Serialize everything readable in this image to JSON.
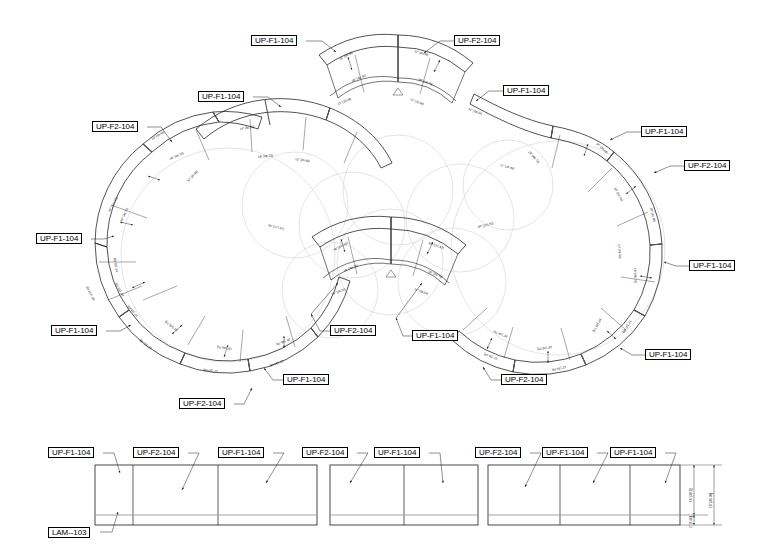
{
  "drawing": {
    "title": "Modular Curved Bench - Plan and Elevation",
    "sheet_bg": "#ffffff",
    "line_color": "#1a1a1a",
    "guide_color": "#d9d9dd",
    "joint_color": "#555555",
    "base_color": "#9a9a9a"
  },
  "part_codes": {
    "f1": "UP-F1-104",
    "f2": "UP-F2-104",
    "lam": "LAM--103"
  },
  "dimensions": {
    "seg_depth": "18\" [46.70]",
    "arc_12": "12\" [30.48]",
    "arc_14": "14\" [36.30]",
    "arc_48": "48\" [121.92]",
    "arc_10": "10\" [26.40]",
    "elev_height": "18\" [46.70]",
    "elev_body": "16\" [38.1]",
    "elev_base": "2\" [7.34]"
  },
  "plan_tags": [
    {
      "id": "tag-plan-1",
      "code": "UP-F1-104",
      "x": 251,
      "y": 35,
      "lx1": 306,
      "ly1": 41,
      "lx2": 322,
      "ly2": 41,
      "lx3": 336,
      "ly3": 52
    },
    {
      "id": "tag-plan-2",
      "code": "UP-F2-104",
      "x": 454,
      "y": 35,
      "lx1": 454,
      "ly1": 41,
      "lx2": 440,
      "ly2": 41,
      "lx3": 424,
      "ly3": 53
    },
    {
      "id": "tag-plan-3",
      "code": "UP-F1-104",
      "x": 198,
      "y": 91,
      "lx1": 253,
      "ly1": 97,
      "lx2": 268,
      "ly2": 97,
      "lx3": 281,
      "ly3": 107
    },
    {
      "id": "tag-plan-4",
      "code": "UP-F1-104",
      "x": 503,
      "y": 85,
      "lx1": 503,
      "ly1": 91,
      "lx2": 489,
      "ly2": 91,
      "lx3": 476,
      "ly3": 101
    },
    {
      "id": "tag-plan-5",
      "code": "UP-F2-104",
      "x": 92,
      "y": 121,
      "lx1": 147,
      "ly1": 127,
      "lx2": 161,
      "ly2": 127,
      "lx3": 172,
      "ly3": 142
    },
    {
      "id": "tag-plan-6",
      "code": "UP-F1-104",
      "x": 641,
      "y": 126,
      "lx1": 641,
      "ly1": 132,
      "lx2": 627,
      "ly2": 132,
      "lx3": 610,
      "ly3": 140
    },
    {
      "id": "tag-plan-7",
      "code": "UP-F2-104",
      "x": 684,
      "y": 160,
      "lx1": 684,
      "ly1": 166,
      "lx2": 670,
      "ly2": 166,
      "lx3": 654,
      "ly3": 173
    },
    {
      "id": "tag-plan-8",
      "code": "UP-F1-104",
      "x": 36,
      "y": 233,
      "lx1": 91,
      "ly1": 239,
      "lx2": 104,
      "ly2": 239,
      "lx3": 114,
      "ly3": 236
    },
    {
      "id": "tag-plan-9",
      "code": "UP-F1-104",
      "x": 689,
      "y": 260,
      "lx1": 689,
      "ly1": 266,
      "lx2": 676,
      "ly2": 266,
      "lx3": 664,
      "ly3": 262
    },
    {
      "id": "tag-plan-10",
      "code": "UP-F1-104",
      "x": 51,
      "y": 325,
      "lx1": 106,
      "ly1": 331,
      "lx2": 120,
      "ly2": 331,
      "lx3": 131,
      "ly3": 325
    },
    {
      "id": "tag-plan-11",
      "code": "UP-F2-104",
      "x": 330,
      "y": 325,
      "lx1": 330,
      "ly1": 331,
      "lx2": 320,
      "ly2": 331,
      "lx3": 311,
      "ly3": 314
    },
    {
      "id": "tag-plan-12",
      "code": "UP-F1-104",
      "x": 412,
      "y": 330,
      "lx1": 412,
      "ly1": 336,
      "lx2": 403,
      "ly2": 336,
      "lx3": 396,
      "ly3": 318
    },
    {
      "id": "tag-plan-13",
      "code": "UP-F1-104",
      "x": 645,
      "y": 349,
      "lx1": 645,
      "ly1": 355,
      "lx2": 632,
      "ly2": 355,
      "lx3": 620,
      "ly3": 348
    },
    {
      "id": "tag-plan-14",
      "code": "UP-F1-104",
      "x": 283,
      "y": 374,
      "lx1": 283,
      "ly1": 380,
      "lx2": 273,
      "ly2": 380,
      "lx3": 264,
      "ly3": 368
    },
    {
      "id": "tag-plan-15",
      "code": "UP-F2-104",
      "x": 501,
      "y": 374,
      "lx1": 501,
      "ly1": 380,
      "lx2": 491,
      "ly2": 380,
      "lx3": 483,
      "ly3": 367
    },
    {
      "id": "tag-plan-16",
      "code": "UP-F2-104",
      "x": 179,
      "y": 398,
      "lx1": 234,
      "ly1": 404,
      "lx2": 244,
      "ly2": 404,
      "lx3": 252,
      "ly3": 388
    }
  ],
  "elevation_tags": [
    {
      "id": "tag-elev-1",
      "code": "UP-F1-104",
      "x": 48,
      "y": 447,
      "lx1": 103,
      "ly1": 453,
      "lx2": 114,
      "ly2": 453,
      "lx3": 120,
      "ly3": 473
    },
    {
      "id": "tag-elev-2",
      "code": "UP-F2-104",
      "x": 133,
      "y": 447,
      "lx1": 188,
      "ly1": 453,
      "lx2": 199,
      "ly2": 453,
      "lx3": 182,
      "ly3": 490
    },
    {
      "id": "tag-elev-3",
      "code": "UP-F1-104",
      "x": 218,
      "y": 447,
      "lx1": 273,
      "ly1": 453,
      "lx2": 284,
      "ly2": 453,
      "lx3": 266,
      "ly3": 483
    },
    {
      "id": "tag-elev-4",
      "code": "UP-F2-104",
      "x": 302,
      "y": 447,
      "lx1": 357,
      "ly1": 453,
      "lx2": 368,
      "ly2": 453,
      "lx3": 350,
      "ly3": 483
    },
    {
      "id": "tag-elev-5",
      "code": "UP-F1-104",
      "x": 374,
      "y": 447,
      "lx1": 429,
      "ly1": 453,
      "lx2": 440,
      "ly2": 453,
      "lx3": 443,
      "ly3": 483
    },
    {
      "id": "tag-elev-6",
      "code": "UP-F2-104",
      "x": 475,
      "y": 447,
      "lx1": 530,
      "ly1": 453,
      "lx2": 541,
      "ly2": 453,
      "lx3": 525,
      "ly3": 487
    },
    {
      "id": "tag-elev-7",
      "code": "UP-F1-104",
      "x": 542,
      "y": 447,
      "lx1": 597,
      "ly1": 453,
      "lx2": 608,
      "ly2": 453,
      "lx3": 593,
      "ly3": 483
    },
    {
      "id": "tag-elev-8",
      "code": "UP-F1-104",
      "x": 610,
      "y": 447,
      "lx1": 665,
      "ly1": 453,
      "lx2": 676,
      "ly2": 453,
      "lx3": 665,
      "ly3": 483
    },
    {
      "id": "tag-elev-lam",
      "code": "LAM--103",
      "x": 48,
      "y": 527,
      "lx1": 100,
      "ly1": 532,
      "lx2": 112,
      "ly2": 532,
      "lx3": 118,
      "ly3": 512
    }
  ],
  "elevation_blocks": [
    {
      "id": "elev-block-1",
      "x": 95,
      "y": 465,
      "w": 222,
      "h": 60,
      "base_y": 515,
      "dividers": [
        38,
        123
      ]
    },
    {
      "id": "elev-block-2",
      "x": 330,
      "y": 465,
      "w": 148,
      "h": 60,
      "base_y": 515,
      "dividers": [
        74
      ]
    },
    {
      "id": "elev-block-3",
      "x": 488,
      "y": 465,
      "w": 192,
      "h": 60,
      "base_y": 515,
      "dividers": [
        72,
        142
      ]
    }
  ],
  "view_labels": {
    "plan": "PLAN VIEW",
    "elevation": "ELEVATION"
  }
}
